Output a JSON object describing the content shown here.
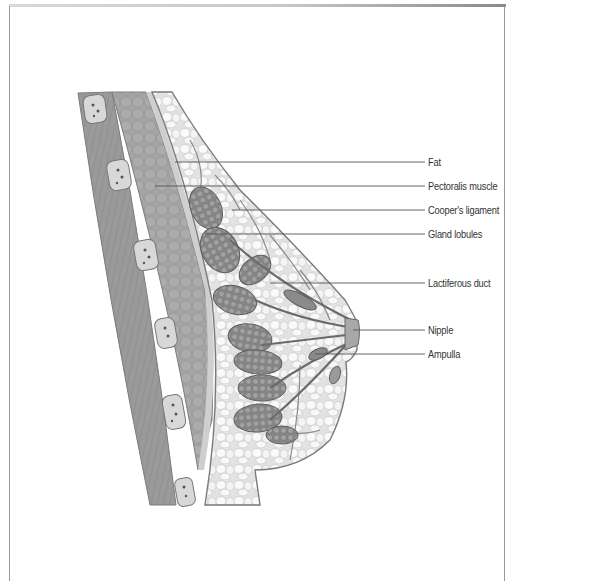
{
  "figure": {
    "labels": [
      {
        "text": "Fat",
        "y": 162,
        "line_start_x": 175
      },
      {
        "text": "Pectoralis muscle",
        "y": 186,
        "line_start_x": 155
      },
      {
        "text": "Cooper's ligament",
        "y": 210,
        "line_start_x": 232
      },
      {
        "text": "Gland lobules",
        "y": 234,
        "line_start_x": 205
      },
      {
        "text": "Lactiferous duct",
        "y": 283,
        "line_start_x": 270
      },
      {
        "text": "Nipple",
        "y": 330,
        "line_start_x": 353
      },
      {
        "text": "Ampulla",
        "y": 354,
        "line_start_x": 315
      }
    ],
    "colors": {
      "line": "#555555",
      "label": "#333333",
      "muscle": "#9c9c9c",
      "fat": "#eeeeee",
      "gland": "#8a8a8a",
      "skin_outline": "#7a7a7a"
    }
  }
}
